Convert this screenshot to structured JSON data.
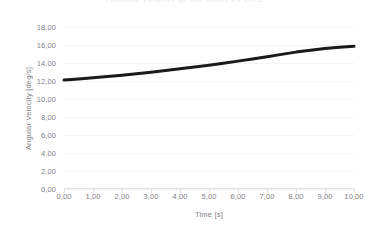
{
  "title_sliver": "Angular Velocity of the Shaft vs Time",
  "axis": {
    "x_title": "Time [s]",
    "y_title": "Angular Velocity [deg/s]"
  },
  "colors": {
    "series": "#1a1a1a",
    "grid": "#f4f4f6",
    "axis": "#e2e2e6",
    "tick_text": "#7f7f85",
    "background": "#ffffff"
  },
  "chart_data": {
    "type": "line",
    "title": "",
    "xlabel": "Time [s]",
    "ylabel": "Angular Velocity [deg/s]",
    "xlim": [
      0,
      10
    ],
    "ylim": [
      0,
      18
    ],
    "xticks": [
      0,
      1,
      2,
      3,
      4,
      5,
      6,
      7,
      8,
      9,
      10
    ],
    "yticks": [
      0,
      2,
      4,
      6,
      8,
      10,
      12,
      14,
      16,
      18
    ],
    "xtick_labels": [
      "0,00",
      "1,00",
      "2,00",
      "3,00",
      "4,00",
      "5,00",
      "6,00",
      "7,00",
      "8,00",
      "9,00",
      "10,00"
    ],
    "ytick_labels": [
      "0,00",
      "2,00",
      "4,00",
      "6,00",
      "8,00",
      "10,00",
      "12,00",
      "14,00",
      "16,00",
      "18,00"
    ],
    "grid": true,
    "legend": false,
    "decimal_separator": ",",
    "series": [
      {
        "name": "Angular Velocity",
        "color": "#1a1a1a",
        "line_width": 3,
        "x": [
          0.0,
          0.5,
          1.0,
          1.5,
          2.0,
          2.5,
          3.0,
          3.5,
          4.0,
          4.5,
          5.0,
          5.5,
          6.0,
          6.5,
          7.0,
          7.5,
          8.0,
          8.5,
          9.0,
          9.5,
          10.0
        ],
        "values": [
          12.1,
          12.23,
          12.36,
          12.5,
          12.65,
          12.81,
          12.98,
          13.16,
          13.35,
          13.55,
          13.76,
          13.98,
          14.21,
          14.45,
          14.7,
          14.96,
          15.21,
          15.42,
          15.6,
          15.74,
          15.85
        ]
      }
    ]
  }
}
